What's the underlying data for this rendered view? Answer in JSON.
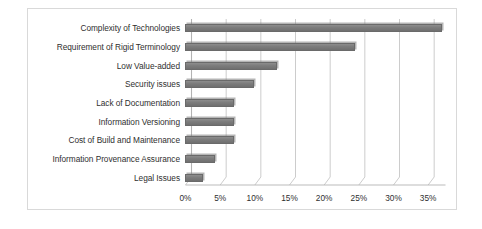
{
  "chart_data": {
    "type": "bar",
    "orientation": "horizontal",
    "title": "",
    "subtitle": "",
    "xlabel": "",
    "ylabel": "",
    "categories": [
      "Complexity of Technologies",
      "Requirement of Rigid Terminology",
      "Low Value-added",
      "Security issues",
      "Lack of Documentation",
      "Information Versioning",
      "Cost of Build and Maintenance",
      "Information Provenance Assurance",
      "Legal Issues"
    ],
    "values": [
      37,
      24.5,
      13.2,
      10,
      7,
      7,
      7,
      4.3,
      2.6
    ],
    "value_format": "percent",
    "xlim": [
      0,
      37.5
    ],
    "xticks": [
      0,
      5,
      10,
      15,
      20,
      25,
      30,
      35
    ],
    "xtick_labels": [
      "0%",
      "5%",
      "10%",
      "15%",
      "20%",
      "25%",
      "30%",
      "35%"
    ],
    "grid": true,
    "grid_axis": "x",
    "legend": false,
    "legend_position": "none",
    "series": [
      {
        "name": "Share of responses",
        "color": "#7d7d7d",
        "values": [
          37,
          24.5,
          13.2,
          10,
          7,
          7,
          7,
          4.3,
          2.6
        ]
      }
    ]
  },
  "style": {
    "bar_color": "#7d7d7d",
    "bar_edge_color": "#6a6a6a",
    "grid_color": "#c6c6c6",
    "axis_color": "#b3b3b3",
    "frame_color": "#d9d9d9",
    "text_color": "#2f2f2f",
    "background": "#ffffff"
  }
}
